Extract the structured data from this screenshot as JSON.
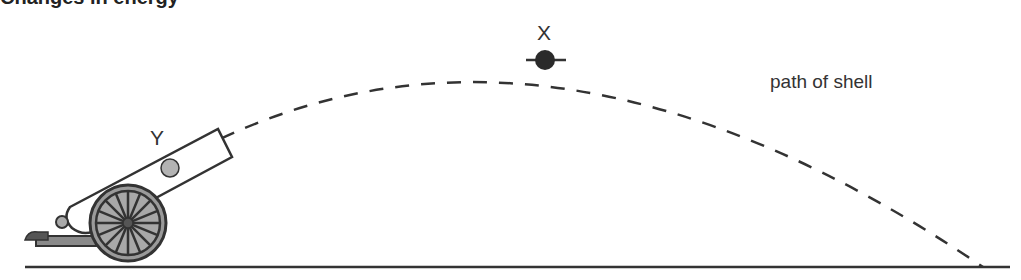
{
  "title_cutoff": "Changes in energy",
  "labels": {
    "apex": "X",
    "inside_barrel": "Y",
    "path": "path of shell"
  },
  "colors": {
    "line": "#333333",
    "shell_x": "#2a2a2a",
    "shell_y": "#b3b3b3",
    "wheel_fill": "#9a9a9a"
  },
  "trajectory": {
    "start": [
      230,
      130
    ],
    "apex": [
      545,
      60
    ],
    "end": [
      983,
      267
    ]
  }
}
